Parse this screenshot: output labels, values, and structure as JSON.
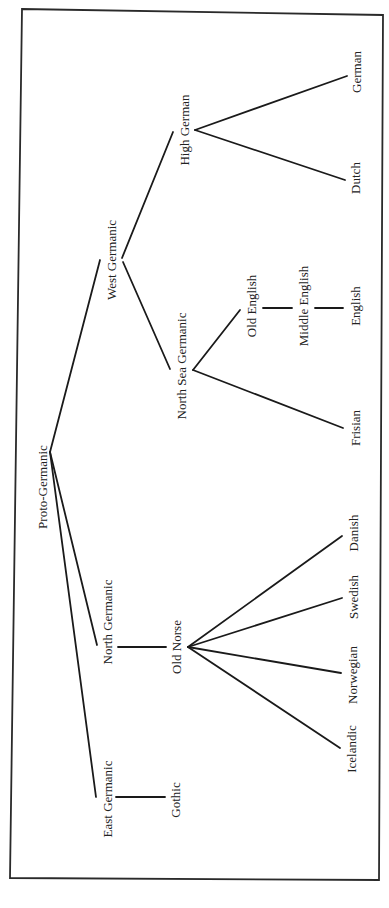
{
  "diagram": {
    "orientation": "rotated-90-ccw",
    "colors": {
      "line": "#1a1a1a",
      "text": "#222222",
      "background": "#ffffff"
    },
    "nodes": {
      "proto_germanic": "Proto-Germanic",
      "west_germanic": "West Germanic",
      "north_germanic": "North Germanic",
      "east_germanic": "East Germanic",
      "high_german": "High German",
      "german": "German",
      "dutch": "Dutch",
      "north_sea_germanic": "North Sea Germanic",
      "old_english": "Old English",
      "middle_english": "Middle English",
      "english": "English",
      "frisian": "Frisian",
      "old_norse": "Old Norse",
      "danish": "Danish",
      "swedish": "Swedish",
      "norwegian": "Norwegian",
      "icelandic": "Icelandic",
      "gothic": "Gothic"
    },
    "edges": [
      [
        "Proto-Germanic",
        "West Germanic"
      ],
      [
        "Proto-Germanic",
        "North Germanic"
      ],
      [
        "Proto-Germanic",
        "East Germanic"
      ],
      [
        "West Germanic",
        "High German"
      ],
      [
        "West Germanic",
        "North Sea Germanic"
      ],
      [
        "High German",
        "German"
      ],
      [
        "High German",
        "Dutch"
      ],
      [
        "North Sea Germanic",
        "Old English"
      ],
      [
        "North Sea Germanic",
        "Frisian"
      ],
      [
        "Old English",
        "Middle English"
      ],
      [
        "Middle English",
        "English"
      ],
      [
        "North Germanic",
        "Old Norse"
      ],
      [
        "Old Norse",
        "Danish"
      ],
      [
        "Old Norse",
        "Swedish"
      ],
      [
        "Old Norse",
        "Norwegian"
      ],
      [
        "Old Norse",
        "Icelandic"
      ],
      [
        "East Germanic",
        "Gothic"
      ]
    ]
  }
}
